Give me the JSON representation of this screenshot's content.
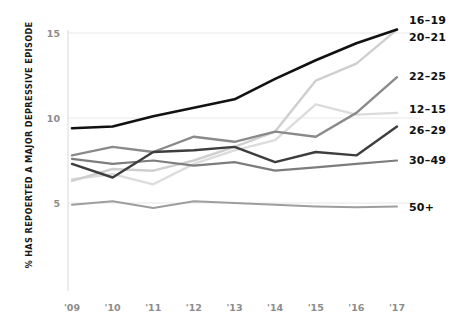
{
  "chart_data": {
    "type": "line",
    "title": "",
    "subtitle": "",
    "xlabel": "",
    "ylabel": "% HAS REPOERTED A MAJOR DEPRESSIVE EPISODE",
    "x": [
      "'09",
      "'10",
      "'11",
      "'12",
      "'13",
      "'14",
      "'15",
      "'16",
      "'17"
    ],
    "x_full": [
      2009,
      2010,
      2011,
      2012,
      2013,
      2014,
      2015,
      2016,
      2017
    ],
    "ylim": [
      2.0,
      16.0
    ],
    "yticks": [
      5,
      10,
      15
    ],
    "ytick_labels": [
      "5",
      "10",
      "15"
    ],
    "grid": true,
    "legend_position": "right-inline",
    "series": [
      {
        "name": "16-19",
        "label": "16–19",
        "color": "#111111",
        "width": 2.6,
        "values": [
          9.4,
          9.5,
          10.1,
          10.6,
          11.1,
          12.3,
          13.4,
          14.4,
          15.2
        ]
      },
      {
        "name": "20-21",
        "label": "20–21",
        "color": "#cfcfcf",
        "width": 2.4,
        "values": [
          6.3,
          7.0,
          6.9,
          7.5,
          8.3,
          9.2,
          12.2,
          13.2,
          15.2
        ]
      },
      {
        "name": "22-25",
        "label": "22–25",
        "color": "#8a8a8a",
        "width": 2.4,
        "values": [
          7.8,
          8.3,
          8.0,
          8.9,
          8.6,
          9.2,
          8.9,
          10.3,
          12.4
        ]
      },
      {
        "name": "12-15",
        "label": "12–15",
        "color": "#dcdcdc",
        "width": 2.4,
        "values": [
          6.4,
          6.7,
          6.1,
          7.3,
          8.1,
          8.7,
          10.8,
          10.2,
          10.3
        ]
      },
      {
        "name": "26-29",
        "label": "26–29",
        "color": "#3d3d3d",
        "width": 2.4,
        "values": [
          7.3,
          6.5,
          8.0,
          8.1,
          8.3,
          7.4,
          8.0,
          7.8,
          9.5
        ]
      },
      {
        "name": "30-49",
        "label": "30–49",
        "color": "#7d7d7d",
        "width": 2.2,
        "values": [
          7.6,
          7.3,
          7.5,
          7.2,
          7.4,
          6.9,
          7.1,
          7.3,
          7.5
        ]
      },
      {
        "name": "50+",
        "label": "50+",
        "color": "#9e9e9e",
        "width": 2.0,
        "values": [
          4.9,
          5.1,
          4.7,
          5.1,
          5.0,
          4.9,
          4.8,
          4.75,
          4.8
        ]
      }
    ]
  },
  "axis": {
    "y_axis_title": "% HAS REPOERTED A MAJOR DEPRESSIVE EPISODE"
  }
}
